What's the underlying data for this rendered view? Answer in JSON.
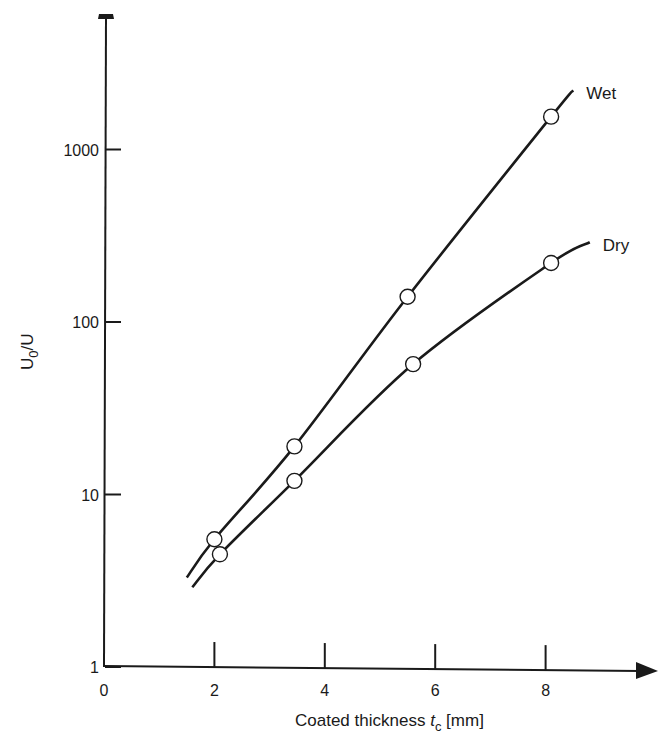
{
  "chart_data": {
    "type": "line",
    "title": "",
    "xlabel": "Coated thickness t_c [mm]",
    "xlabel_parts": {
      "main": "Coated thickness ",
      "var": "t",
      "sub": "c",
      "unit": " [mm]"
    },
    "ylabel": "U_0/U",
    "ylabel_parts": {
      "main": "U",
      "sub": "0",
      "rest": "/U"
    },
    "xscale": "linear",
    "yscale": "log",
    "xlim": [
      0,
      10
    ],
    "ylim": [
      1,
      10000
    ],
    "x_ticks": [
      0,
      2,
      4,
      6,
      8
    ],
    "x_tick_labels": [
      "0",
      "2",
      "4",
      "6",
      "8"
    ],
    "y_ticks": [
      1,
      10,
      100,
      1000
    ],
    "y_tick_labels": [
      "1",
      "10",
      "100",
      "1000"
    ],
    "grid": false,
    "legend": "inline labels at line ends",
    "series": [
      {
        "name": "Wet",
        "marker": "open-circle",
        "points": [
          {
            "x": 2.0,
            "y": 5.5
          },
          {
            "x": 3.45,
            "y": 19
          },
          {
            "x": 5.5,
            "y": 140
          },
          {
            "x": 8.1,
            "y": 1550
          }
        ],
        "curve": [
          [
            1.5,
            3.3
          ],
          [
            2.0,
            5.5
          ],
          [
            3.45,
            19
          ],
          [
            5.5,
            140
          ],
          [
            8.1,
            1550
          ],
          [
            8.5,
            2200
          ]
        ]
      },
      {
        "name": "Dry",
        "marker": "open-circle",
        "points": [
          {
            "x": 2.1,
            "y": 4.5
          },
          {
            "x": 3.45,
            "y": 12
          },
          {
            "x": 5.6,
            "y": 57
          },
          {
            "x": 8.1,
            "y": 220
          }
        ],
        "curve": [
          [
            1.6,
            2.9
          ],
          [
            2.1,
            4.5
          ],
          [
            3.45,
            12
          ],
          [
            5.6,
            57
          ],
          [
            8.1,
            220
          ],
          [
            8.8,
            290
          ]
        ]
      }
    ]
  }
}
